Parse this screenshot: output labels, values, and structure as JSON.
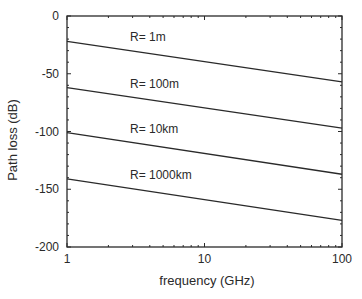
{
  "chart_data": {
    "type": "line",
    "title": "",
    "xlabel": "frequency (GHz)",
    "ylabel": "Path loss (dB)",
    "xscale": "log",
    "xlim": [
      1,
      100
    ],
    "ylim": [
      -200,
      0
    ],
    "grid": false,
    "legend": "inline labels",
    "x_ticks": [
      1,
      10,
      100
    ],
    "x_tick_labels": [
      "1",
      "10",
      "100"
    ],
    "y_ticks": [
      0,
      -50,
      -100,
      -150,
      -200
    ],
    "y_tick_labels": [
      "0",
      "-50",
      "-100",
      "-150",
      "-200"
    ],
    "x": [
      1,
      100
    ],
    "series": [
      {
        "name": "R= 1m",
        "values": [
          -22,
          -57
        ]
      },
      {
        "name": "R= 100m",
        "values": [
          -62,
          -97
        ]
      },
      {
        "name": "R= 10km",
        "values": [
          -101,
          -137
        ]
      },
      {
        "name": "R= 1000km",
        "values": [
          -141,
          -177
        ]
      }
    ]
  },
  "colors": {
    "line": "#2a2a2a",
    "axis": "#2a2a2a",
    "background": "#ffffff"
  }
}
